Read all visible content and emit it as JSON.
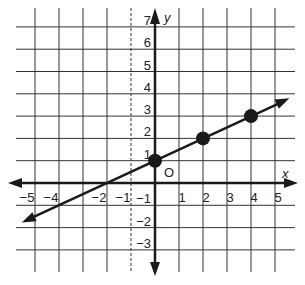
{
  "chart_data": {
    "type": "line",
    "title": "",
    "xlabel": "x",
    "ylabel": "y",
    "origin_label": "O",
    "xlim": [
      -5.5,
      5.5
    ],
    "ylim": [
      -3.5,
      7.5
    ],
    "grid": true,
    "x_ticks": [
      -5,
      -4,
      -2,
      -1,
      1,
      2,
      3,
      4,
      5
    ],
    "x_tick_labels": [
      "−5",
      "−4",
      "−2",
      "−1",
      "1",
      "2",
      "3",
      "4",
      "5"
    ],
    "y_ticks": [
      7,
      6,
      5,
      4,
      3,
      2,
      1,
      -1,
      -2,
      -3
    ],
    "y_tick_labels": [
      "7",
      "6",
      "5",
      "4",
      "3",
      "2",
      "1",
      "−1",
      "−2",
      "−3"
    ],
    "series": [
      {
        "name": "line",
        "equation": "y = 0.5x + 1",
        "slope": 0.5,
        "intercept": 1,
        "x_intercept": -2,
        "extends_both_directions": true,
        "x_range_drawn": [
          -5.0,
          5.8
        ]
      }
    ],
    "points": [
      {
        "x": 0,
        "y": 1
      },
      {
        "x": 2,
        "y": 2
      },
      {
        "x": 4,
        "y": 3
      }
    ]
  },
  "colors": {
    "ink": "#1a1a1a",
    "grid": "#333333",
    "background": "#ffffff"
  }
}
